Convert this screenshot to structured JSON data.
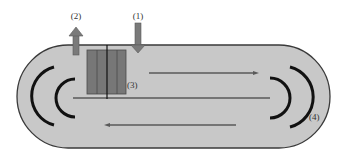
{
  "labels": {
    "inlet": "(1)",
    "outlet": "(2)",
    "block": "(3)",
    "reflector": "(4)"
  },
  "colors": {
    "background": "#ffffff",
    "stadium_fill": "#c8c8c8",
    "stadium_stroke": "#3a3a3a",
    "arrow_fill": "#7a7a7a",
    "arrow_stroke": "#5a5a5a",
    "block_fill": "#777777",
    "block_lines": "#4a4a4a",
    "flow_lines": "#5a5a5a",
    "bracket": "#111111",
    "label": "#333333"
  },
  "elements": {
    "inlet_arrow": {
      "direction": "down",
      "label": "(1)"
    },
    "outlet_arrow": {
      "direction": "up",
      "label": "(2)"
    },
    "block": {
      "segments": 4,
      "label": "(3)"
    },
    "flow_arrows": [
      {
        "direction": "right",
        "position": "upper"
      },
      {
        "direction": "none",
        "position": "middle"
      },
      {
        "direction": "left",
        "position": "lower"
      }
    ],
    "left_brackets": {
      "count": 2,
      "orientation": "open-right"
    },
    "right_brackets": {
      "count": 2,
      "orientation": "open-left",
      "label": "(4)"
    }
  }
}
